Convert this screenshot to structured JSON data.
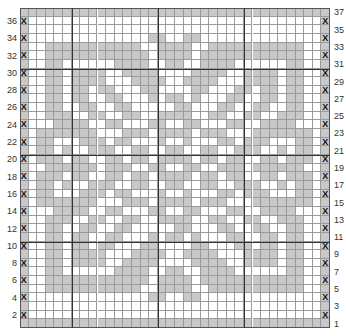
{
  "chart_data": {
    "type": "table",
    "rows": 37,
    "cols": 36,
    "left_labels": [
      36,
      34,
      32,
      30,
      28,
      26,
      24,
      22,
      20,
      18,
      16,
      14,
      12,
      10,
      8,
      6,
      4,
      2
    ],
    "right_labels": [
      37,
      35,
      33,
      31,
      29,
      27,
      25,
      23,
      21,
      19,
      17,
      15,
      13,
      11,
      9,
      7,
      5,
      3,
      1
    ],
    "edge_marker": "X",
    "contrast_color": "#c8c8c8",
    "main_color": "#ffffff",
    "grid": [
      "GGGGGGGGGGGGGGGGGGGGGGGGGGGGGGGGGGGG",
      "X..................................X",
      "G..................................G",
      "X..............GG..GG..............X",
      "G..GGGGGGGGGGG..GGGG..GGGGGGGGGGG..G",
      "X..GGGGGGGGGGGG.GGGG.GGGGGGGGGGGG..X",
      "G..GG......GGGG..GG..GGGG......GG..G",
      "X..GG.GGGG..GGGG....GGGG..GGGG.GG..X",
      "G..GG.GGGG...GGGG..GGGG...GGGG.GG..G",
      "X..GG.GG.GG...GG....GG...GG.GG.GG..X",
      "G..GG.GG..GG...G.GG.G...GG..GG.GG..G",
      "X..GG..GG..GG.....GG...GG..GG..GG..X",
      "G..GGG..GG..GG..GGGG..GG..GG..GGG..G",
      "X...GGGG..GG...GG..GG...GG..GGGG...X",
      "G.GGGGGGG...GGG.GGGG.GGG...GGGGGGG.G",
      "X.GG...GGG.GG...G..G...GG.GGG...GG.X",
      "G.GG.G..GGG..GG..GG..GG..GGG..G.GG.G",
      "X.GGG.GG..GG.GG.GGGG.GG.GG..GG.GGG.X",
      "G..GGGGGG.GGG..GG..GG..GGG.GGGGGG..G",
      "X.GGG.GG..GG.GG.GGGG.GG.GG..GG.GGG.X",
      "G.GG.G..GGG..GG..GG..GG..GGG..G.GG.G",
      "X.GG...GGG.GG...G..G...GG.GGG...GG.X",
      "G.GGGGGGG...GGG.GGGG.GGG...GGGGGGG.G",
      "X...GGGG..GG...GG..GG...GG..GGGG...X",
      "G..GGG..GG..GG..GGGG..GG..GG..GGG..G",
      "X..GG..GG..GG.....GG...GG..GG..GG..X",
      "G..GG.GG..GG...G.GG.G...GG..GG.GG..G",
      "X..GG.GG.GG...GG....GG...GG.GG.GG..X",
      "G..GG.GGGG...GGGG..GGGG...GGGG.GG..G",
      "X..GG.GGGG..GGGG....GGGG..GGGG.GG..X",
      "G..GG......GGGG..GG..GGGG......GG..G",
      "X..GGGGGGGGGGGG.GGGG.GGGGGGGGGGGG..X",
      "G..GGGGGGGGGGG..GGGG..GGGGGGGGGGG..G",
      "X..............GG..GG..............X",
      "G..................................G",
      "X..................................X",
      "GGGGGGGGGGGGGGGGGGGGGGGGGGGGGGGGGGGG"
    ]
  }
}
